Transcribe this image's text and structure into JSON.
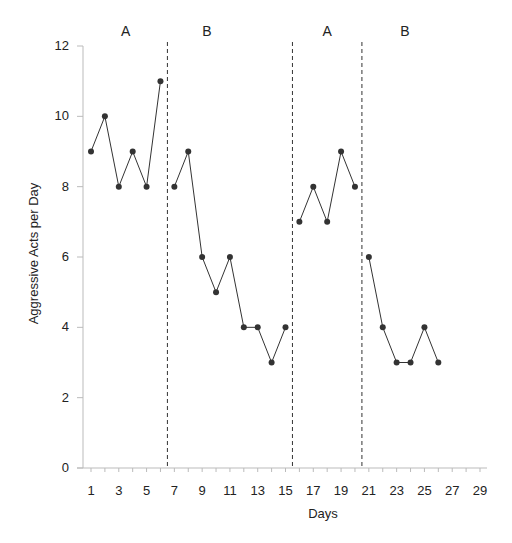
{
  "chart_data": {
    "type": "line",
    "title": "",
    "xlabel": "Days",
    "ylabel": "Aggressive Acts per Day",
    "ylim": [
      0,
      12
    ],
    "xlim": [
      0.5,
      29.5
    ],
    "yticks": [
      0,
      2,
      4,
      6,
      8,
      10,
      12
    ],
    "xticks": [
      1,
      3,
      5,
      7,
      9,
      11,
      13,
      15,
      17,
      19,
      21,
      23,
      25,
      27,
      29
    ],
    "grid": false,
    "legend": "none",
    "phases": [
      {
        "label": "A",
        "days": [
          1,
          6
        ]
      },
      {
        "label": "B",
        "days": [
          7,
          15
        ]
      },
      {
        "label": "A",
        "days": [
          16,
          20
        ]
      },
      {
        "label": "B",
        "days": [
          21,
          26
        ]
      }
    ],
    "phase_change_lines": [
      6.5,
      15.5,
      20.5
    ],
    "series": [
      {
        "name": "A1",
        "x": [
          1,
          2,
          3,
          4,
          5,
          6
        ],
        "values": [
          9,
          10,
          8,
          9,
          8,
          11
        ]
      },
      {
        "name": "B1",
        "x": [
          7,
          8,
          9,
          10,
          11,
          12,
          13,
          14,
          15
        ],
        "values": [
          8,
          9,
          6,
          5,
          6,
          4,
          4,
          3,
          4
        ]
      },
      {
        "name": "A2",
        "x": [
          16,
          17,
          18,
          19,
          20
        ],
        "values": [
          7,
          8,
          7,
          9,
          8
        ]
      },
      {
        "name": "B2",
        "x": [
          21,
          22,
          23,
          24,
          25,
          26
        ],
        "values": [
          6,
          4,
          3,
          3,
          4,
          3
        ]
      }
    ],
    "colors": {
      "line": "#333333",
      "marker": "#333333",
      "axis": "#bbbbbb",
      "phase_line": "#333333"
    }
  }
}
